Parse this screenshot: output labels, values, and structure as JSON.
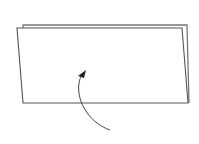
{
  "diagram": {
    "type": "folding-instruction",
    "elements": [
      {
        "name": "back-sheet",
        "shape": "parallelogram"
      },
      {
        "name": "front-sheet",
        "shape": "parallelogram"
      },
      {
        "name": "fold-arrow",
        "shape": "curved-arrow",
        "direction": "up"
      }
    ]
  },
  "colors": {
    "background": "#ffffff",
    "stroke": "#555555",
    "arrow": "#333333"
  }
}
